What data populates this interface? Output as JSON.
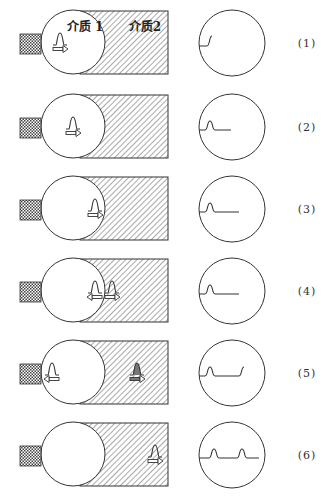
{
  "diagram": {
    "medium_labels": {
      "medium1": "介质 1",
      "medium2": "介质2"
    },
    "colors": {
      "stroke": "#333333",
      "hatch": "#555555",
      "background": "#ffffff"
    },
    "rows": [
      {
        "index": 1,
        "label": "(1)",
        "cy": 42,
        "pulses": [
          {
            "x": 60,
            "dir": "right",
            "style": "outline"
          }
        ],
        "screen_trace": "step"
      },
      {
        "index": 2,
        "label": "(2)",
        "cy": 126,
        "pulses": [
          {
            "x": 73,
            "dir": "right",
            "style": "outline"
          }
        ],
        "screen_trace": "one-pulse"
      },
      {
        "index": 3,
        "label": "(3)",
        "cy": 208,
        "pulses": [
          {
            "x": 95,
            "dir": "right",
            "style": "outline"
          }
        ],
        "screen_trace": "one-pulse-long"
      },
      {
        "index": 4,
        "label": "(4)",
        "cy": 290,
        "pulses": [
          {
            "x": 95,
            "dir": "left",
            "style": "outline"
          },
          {
            "x": 112,
            "dir": "right",
            "style": "outline"
          }
        ],
        "screen_trace": "one-pulse-long"
      },
      {
        "index": 5,
        "label": "(5)",
        "cy": 372,
        "pulses": [
          {
            "x": 52,
            "dir": "left",
            "style": "outline"
          },
          {
            "x": 137,
            "dir": "right",
            "style": "filled"
          }
        ],
        "screen_trace": "pulse-and-step"
      },
      {
        "index": 6,
        "label": "(6)",
        "cy": 454,
        "pulses": [
          {
            "x": 155,
            "dir": "right",
            "style": "outline"
          }
        ],
        "screen_trace": "two-pulses"
      }
    ]
  }
}
